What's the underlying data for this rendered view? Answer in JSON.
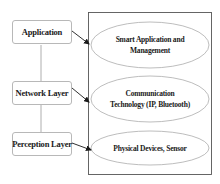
{
  "diagram": {
    "layers": [
      {
        "id": "application",
        "label": "Application",
        "top": 20
      },
      {
        "id": "network",
        "label": "Network Layer",
        "top": 81
      },
      {
        "id": "perception",
        "label": "Perception Layer",
        "top": 132
      }
    ],
    "components": [
      {
        "id": "smart-application",
        "label": "Smart Application and Management",
        "line1": "Smart Application and",
        "line2": "Management"
      },
      {
        "id": "communication-technology",
        "label": "Communication Technology (IP, Bluetooth)",
        "line1": "Communication",
        "line2": "Technology (IP, Bluetooth)"
      },
      {
        "id": "physical-devices",
        "label": "Physical Devices, Sensor",
        "line1": "Physical Devices, Sensor",
        "line2": ""
      }
    ],
    "colors": {
      "box_border": "#b8b8b8",
      "container_border": "#555555",
      "ellipse_border": "#a0a0a0",
      "connector": "#9a9a9a",
      "arrow": "#1a1a1a",
      "text": "#1a1a1a"
    }
  }
}
